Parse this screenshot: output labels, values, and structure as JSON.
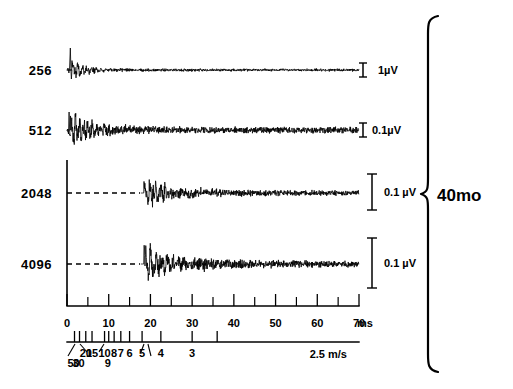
{
  "figure": {
    "group_label": "40mo",
    "brace_name": "group-brace"
  },
  "traces": [
    {
      "label": "256",
      "scale_label": "1µV",
      "scale_style": "small-i",
      "has_dashed_baseline": false,
      "baseline_y": 70
    },
    {
      "label": "512",
      "scale_label": "0.1µV",
      "scale_style": "small-i",
      "has_dashed_baseline": false,
      "baseline_y": 130
    },
    {
      "label": "2048",
      "scale_label": "0.1 µV",
      "scale_style": "tall-bar",
      "has_dashed_baseline": true,
      "baseline_y": 193
    },
    {
      "label": "4096",
      "scale_label": "0.1 µV",
      "scale_style": "tall-bar",
      "has_dashed_baseline": true,
      "baseline_y": 264
    }
  ],
  "time_axis": {
    "unit": "ms",
    "unit_label": "ms",
    "major_ticks": [
      0,
      10,
      20,
      30,
      40,
      50,
      60,
      70
    ],
    "major_tick_labels": [
      "0",
      "10",
      "20",
      "30",
      "40",
      "50",
      "60",
      "70"
    ],
    "minor_ticks": [
      5,
      15,
      25,
      35,
      45,
      55,
      65
    ],
    "range": [
      0,
      70
    ]
  },
  "velocity_axis": {
    "unit": "m/s",
    "unit_label": "2.5 m/s",
    "ticks": [
      {
        "value": "50",
        "time_ms": 1.8,
        "label_offset": "low"
      },
      {
        "value": "30",
        "time_ms": 3.0,
        "label_offset": "low"
      },
      {
        "value": "20",
        "time_ms": 4.5,
        "label_offset": "high"
      },
      {
        "value": "15",
        "time_ms": 6.0,
        "label_offset": "high"
      },
      {
        "value": "10",
        "time_ms": 9.0,
        "label_offset": "high"
      },
      {
        "value": "9",
        "time_ms": 10.0,
        "label_offset": "low"
      },
      {
        "value": "8",
        "time_ms": 11.3,
        "label_offset": "high"
      },
      {
        "value": "7",
        "time_ms": 12.9,
        "label_offset": "high"
      },
      {
        "value": "6",
        "time_ms": 15.0,
        "label_offset": "high"
      },
      {
        "value": "5",
        "time_ms": 18.0,
        "label_offset": "high"
      },
      {
        "value": "4",
        "time_ms": 22.5,
        "label_offset": "high"
      },
      {
        "value": "3",
        "time_ms": 30.0,
        "label_offset": "high"
      },
      {
        "value": "2.5",
        "time_ms": 36.0,
        "label_offset": "high"
      }
    ]
  },
  "chart_data": {
    "type": "line",
    "title": "",
    "xlabel": "ms",
    "ylabel": "",
    "xlim": [
      0,
      70
    ],
    "grid": false,
    "legend": "none",
    "annotations": [
      "40mo"
    ],
    "series": [
      {
        "name": "256",
        "amplitude_scale_uv": 1,
        "scale_bar_label": "1µV",
        "onset_ms": 0,
        "description": "sharp biphasic spike at 0-2 ms followed by rapidly damped high-frequency oscillation decaying to flat baseline by ~20 ms"
      },
      {
        "name": "512",
        "amplitude_scale_uv": 0.1,
        "scale_bar_label": "0.1µV",
        "onset_ms": 0,
        "description": "large amplitude high-frequency burst 0-12 ms decaying into low-level noise after ~25 ms"
      },
      {
        "name": "2048",
        "amplitude_scale_uv": 0.1,
        "scale_bar_label": "0.1 µV",
        "onset_ms": 18,
        "description": "flat dashed baseline 0-18 ms, then burst of oscillation peaking ~19-24 ms, decaying into noise"
      },
      {
        "name": "4096",
        "amplitude_scale_uv": 0.1,
        "scale_bar_label": "0.1 µV",
        "onset_ms": 18,
        "description": "flat dashed baseline 0-18 ms, then large burst of oscillation 19-30 ms, decaying into noise"
      }
    ],
    "x_ticks": [
      0,
      10,
      20,
      30,
      40,
      50,
      60,
      70
    ],
    "secondary_axis": {
      "label": "m/s",
      "ticks": [
        "50",
        "30",
        "20",
        "15",
        "10",
        "9",
        "8",
        "7",
        "6",
        "5",
        "4",
        "3",
        "2.5"
      ]
    }
  }
}
